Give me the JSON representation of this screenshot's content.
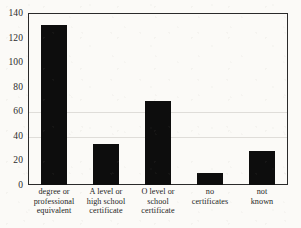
{
  "chart_data": {
    "type": "bar",
    "title": "",
    "subtitle": "",
    "xlabel": "",
    "ylabel": "",
    "ylim": [
      0,
      140
    ],
    "yticks": [
      0,
      20,
      40,
      60,
      80,
      100,
      120,
      140
    ],
    "ytick_labels": [
      "0",
      "20",
      "40",
      "60",
      "80",
      "100",
      "120",
      "140"
    ],
    "grid": false,
    "legend": null,
    "orientation": "vertical",
    "bar_color": "#0d0d0d",
    "categories": [
      "degree or professional equivalent",
      "A level or high school certificate",
      "O level or school certificate",
      "no certificates",
      "not known"
    ],
    "category_lines": [
      [
        "degree or",
        "professional",
        "equivalent"
      ],
      [
        "A level or",
        "high school",
        "certificate"
      ],
      [
        "O level or",
        "school",
        "certificate"
      ],
      [
        "no",
        "certificates"
      ],
      [
        "not",
        "known"
      ]
    ],
    "values": [
      130,
      33,
      68,
      10,
      28
    ]
  },
  "figure": {
    "background_color": "#fbfaf7",
    "frame_color": "#2a2a2a"
  }
}
